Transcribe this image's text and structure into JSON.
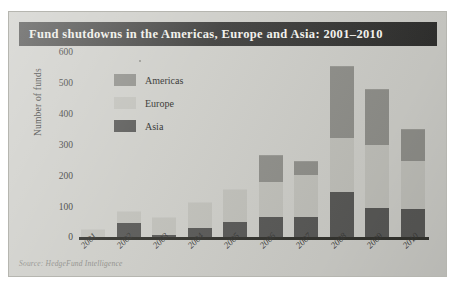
{
  "chart": {
    "title": "Fund shutdowns in the Americas, Europe and Asia: 2001–2010",
    "source": "Source: HedgeFund Intelligence"
  },
  "legend": {
    "items": [
      {
        "label": "Americas",
        "color": "#8f8f8a",
        "swatch_name": "legend-swatch-americas"
      },
      {
        "label": "Europe",
        "color": "#c0c0ba",
        "swatch_name": "legend-swatch-europe"
      },
      {
        "label": "Asia",
        "color": "#595957",
        "swatch_name": "legend-swatch-asia"
      }
    ]
  },
  "axes": {
    "yticks": [
      "600",
      "500",
      "400",
      "300",
      "200",
      "100",
      "0"
    ],
    "ylabel": "Number of funds"
  },
  "chart_data": {
    "type": "bar",
    "title": "Fund shutdowns in the Americas, Europe and Asia: 2001–2010",
    "subtitle": "",
    "xlabel": "",
    "ylabel": "Number of funds",
    "ylim": [
      0,
      600
    ],
    "ytick_step": 100,
    "grid": false,
    "stacked": true,
    "stack_order_bottom_to_top": [
      "Asia",
      "Europe",
      "Americas"
    ],
    "legend_position": "inside-upper-left",
    "categories": [
      "2001",
      "2002",
      "2003",
      "2004",
      "2005",
      "2006",
      "2007",
      "2008",
      "2009",
      "2010"
    ],
    "series": [
      {
        "name": "Americas",
        "color": "#8f8f8a",
        "values": [
          0,
          0,
          0,
          0,
          0,
          85,
          45,
          235,
          180,
          105
        ]
      },
      {
        "name": "Europe",
        "color": "#c0c0ba",
        "values": [
          25,
          40,
          60,
          85,
          105,
          115,
          135,
          175,
          205,
          155
        ]
      },
      {
        "name": "Asia",
        "color": "#595957",
        "values": [
          0,
          45,
          5,
          30,
          50,
          65,
          65,
          145,
          95,
          90
        ]
      }
    ],
    "totals": [
      25,
      85,
      65,
      115,
      155,
      265,
      245,
      555,
      480,
      350
    ]
  },
  "colors": {
    "title_bar": "#3a3a38",
    "title_text": "#f2f1ec",
    "page_background": "#cdcdc8",
    "axis": "#34342f"
  }
}
